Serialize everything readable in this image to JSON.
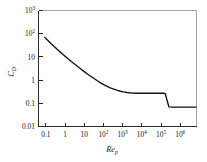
{
  "chart_data": {
    "type": "line",
    "title": "",
    "subtitle": "",
    "xlabel": "Re",
    "xlabel_sub": "p",
    "ylabel": "C",
    "ylabel_sub": "D",
    "xscale": "log",
    "yscale": "log",
    "xlim": [
      0.05,
      5000000
    ],
    "ylim": [
      0.01,
      5000
    ],
    "grid": false,
    "legend": false,
    "legend_position": "none",
    "line_color": "#111111",
    "axis_color": "#2a2a2a",
    "frame_color": "#8e8e8e",
    "background_color": "#ffffff",
    "x_ticks": [
      {
        "value": 0.1,
        "label": "0.1",
        "mantissa": "0.1",
        "exponent": ""
      },
      {
        "value": 1,
        "label": "1",
        "mantissa": "1",
        "exponent": ""
      },
      {
        "value": 10,
        "label": "10",
        "mantissa": "10",
        "exponent": ""
      },
      {
        "value": 100,
        "label": "10^2",
        "mantissa": "10",
        "exponent": "2"
      },
      {
        "value": 1000,
        "label": "10^3",
        "mantissa": "10",
        "exponent": "3"
      },
      {
        "value": 10000,
        "label": "10^4",
        "mantissa": "10",
        "exponent": "4"
      },
      {
        "value": 100000,
        "label": "10^5",
        "mantissa": "10",
        "exponent": "5"
      },
      {
        "value": 1000000,
        "label": "10^6",
        "mantissa": "10",
        "exponent": "6"
      }
    ],
    "y_ticks": [
      {
        "value": 0.01,
        "label": "0.01",
        "mantissa": "0.01",
        "exponent": ""
      },
      {
        "value": 0.1,
        "label": "0.1",
        "mantissa": "0.1",
        "exponent": ""
      },
      {
        "value": 1,
        "label": "1",
        "mantissa": "1",
        "exponent": ""
      },
      {
        "value": 10,
        "label": "10",
        "mantissa": "10",
        "exponent": ""
      },
      {
        "value": 100,
        "label": "10^2",
        "mantissa": "10",
        "exponent": "2"
      },
      {
        "value": 1000,
        "label": "10^3",
        "mantissa": "10",
        "exponent": "3"
      }
    ],
    "series": [
      {
        "name": "Drag coefficient",
        "x": [
          0.1,
          0.15,
          0.2,
          0.3,
          0.5,
          0.7,
          1,
          1.5,
          2,
          3,
          5,
          7,
          10,
          15,
          20,
          30,
          50,
          70,
          100,
          150,
          200,
          300,
          500,
          700,
          1000,
          1500,
          2000,
          3000,
          5000,
          10000,
          30000,
          100000,
          130000,
          160000,
          200000,
          300000,
          1000000,
          3000000,
          5000000
        ],
        "y": [
          248,
          168,
          128,
          88,
          56,
          42,
          31,
          22,
          17.5,
          12.8,
          8.6,
          6.7,
          5.1,
          3.8,
          3.1,
          2.4,
          1.72,
          1.4,
          1.15,
          0.93,
          0.82,
          0.7,
          0.59,
          0.54,
          0.5,
          0.47,
          0.455,
          0.44,
          0.43,
          0.43,
          0.43,
          0.43,
          0.42,
          0.2,
          0.092,
          0.09,
          0.09,
          0.09,
          0.09
        ]
      }
    ],
    "annotations": [
      {
        "name": "stokes-regime",
        "text": ""
      },
      {
        "name": "newton-plateau",
        "value": 0.43
      },
      {
        "name": "drag-crisis",
        "x": 150000,
        "value_after": 0.09
      }
    ]
  }
}
